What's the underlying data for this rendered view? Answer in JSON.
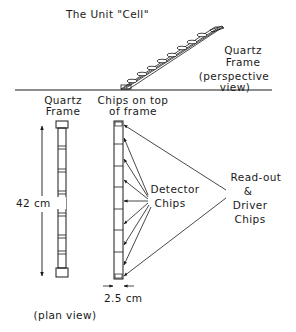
{
  "title": "The Unit \"Cell\"",
  "perspective": {
    "label_line1": "Quartz",
    "label_line2": "Frame",
    "label_line3": "(perspective",
    "label_line4": "view)"
  },
  "plan": {
    "frame_label_line1": "Quartz",
    "frame_label_line2": "Frame",
    "chips_label_line1": "Chips on top",
    "chips_label_line2": "of frame",
    "length_label": "42 cm",
    "width_label": "2.5 cm",
    "view_label": "(plan view)",
    "detector_label_line1": "Detector",
    "detector_label_line2": "Chips",
    "readout_label_line1": "Read-out",
    "readout_label_line2": "&",
    "readout_label_line3": "Driver",
    "readout_label_line4": "Chips"
  },
  "colors": {
    "ink": "#1a1a1a",
    "background": "#ffffff"
  }
}
